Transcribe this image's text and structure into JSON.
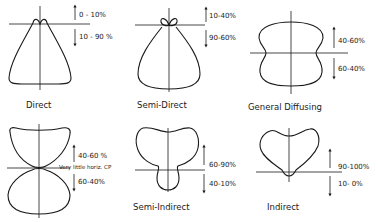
{
  "panels": [
    {
      "name": "Direct",
      "upward": "0 - 10%",
      "downward": "10 - 90 %"
    },
    {
      "name": "Semi-Direct",
      "upward": "10-40%",
      "downward": "90-60%"
    },
    {
      "name": "General Diffusing",
      "upward": "40-60%",
      "downward": "60-40%"
    },
    {
      "name": "",
      "upward": "40-60 %",
      "downward": "60-40%",
      "note": "Very little horiz. CP"
    },
    {
      "name": "Semi-Indirect",
      "upward": "60-90%",
      "downward": "40-10%"
    },
    {
      "name": "Indirect",
      "upward": "90-100%",
      "downward": "10- 0%"
    }
  ],
  "colors": {
    "line": "#1a1a1a",
    "background": "#ffffff"
  }
}
